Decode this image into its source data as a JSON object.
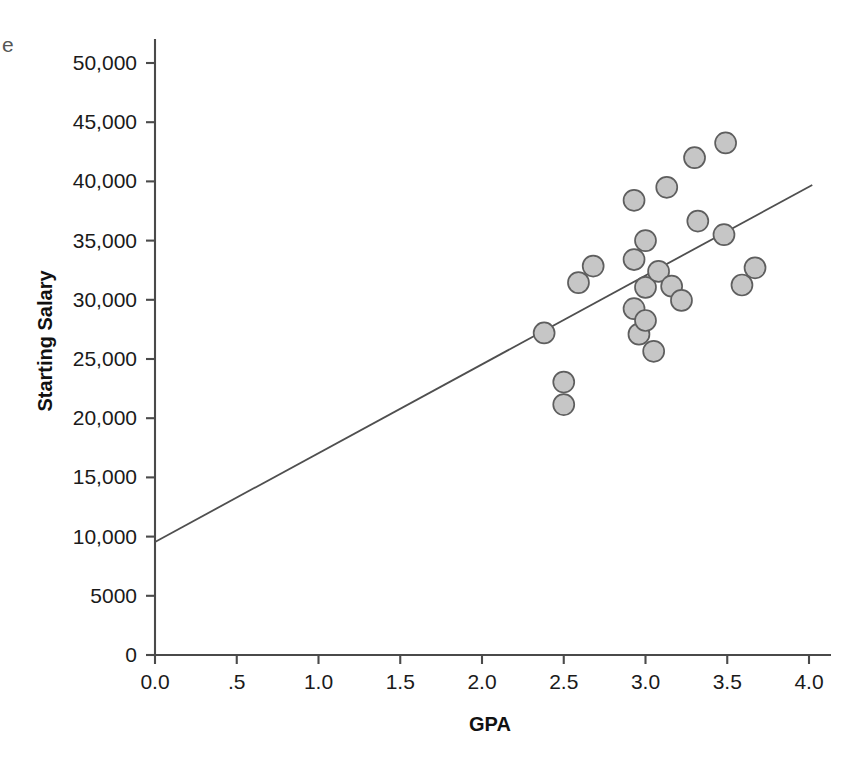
{
  "edge_fragment": "e",
  "chart_data": {
    "type": "scatter",
    "title": "",
    "xlabel": "GPA",
    "ylabel": "Starting Salary",
    "xlim": [
      0.0,
      4.0
    ],
    "ylim": [
      0,
      52000
    ],
    "grid": false,
    "legend": "none",
    "xticks": [
      0.0,
      0.5,
      1.0,
      1.5,
      2.0,
      2.5,
      3.0,
      3.5,
      4.0
    ],
    "xtick_labels": [
      "0.0",
      ".5",
      "1.0",
      "1.5",
      "2.0",
      "2.5",
      "3.0",
      "3.5",
      "4.0"
    ],
    "yticks": [
      0,
      5000,
      10000,
      15000,
      20000,
      25000,
      30000,
      35000,
      40000,
      45000,
      50000
    ],
    "ytick_labels": [
      "0",
      "5000",
      "10,000",
      "15,000",
      "20,000",
      "25,000",
      "30,000",
      "35,000",
      "40,000",
      "45,000",
      "50,000"
    ],
    "marker_color": "#c6c6c6",
    "marker_edge_color": "#5e5e5e",
    "line_color": "#4f4f4f",
    "points": [
      {
        "x": 2.38,
        "y": 27200
      },
      {
        "x": 2.5,
        "y": 23050
      },
      {
        "x": 2.5,
        "y": 21150
      },
      {
        "x": 2.59,
        "y": 31450
      },
      {
        "x": 2.68,
        "y": 32850
      },
      {
        "x": 2.93,
        "y": 38400
      },
      {
        "x": 2.93,
        "y": 33400
      },
      {
        "x": 2.93,
        "y": 29250
      },
      {
        "x": 2.96,
        "y": 27100
      },
      {
        "x": 3.0,
        "y": 35000
      },
      {
        "x": 3.0,
        "y": 31050
      },
      {
        "x": 3.0,
        "y": 28250
      },
      {
        "x": 3.05,
        "y": 25650
      },
      {
        "x": 3.08,
        "y": 32400
      },
      {
        "x": 3.13,
        "y": 39500
      },
      {
        "x": 3.16,
        "y": 31150
      },
      {
        "x": 3.22,
        "y": 29950
      },
      {
        "x": 3.3,
        "y": 42000
      },
      {
        "x": 3.32,
        "y": 36650
      },
      {
        "x": 3.48,
        "y": 35500
      },
      {
        "x": 3.49,
        "y": 43250
      },
      {
        "x": 3.59,
        "y": 31250
      },
      {
        "x": 3.67,
        "y": 32700
      }
    ],
    "fit_line": {
      "x_start": 0.0,
      "y_start": 9550,
      "x_end": 4.02,
      "y_end": 39700
    }
  }
}
